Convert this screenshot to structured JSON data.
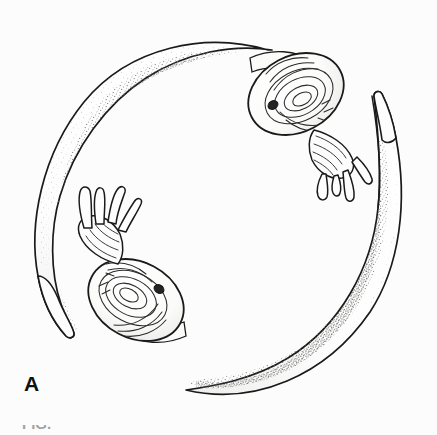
{
  "figure": {
    "panel_label": "A",
    "caption_partial": "FIG.",
    "medium": "pen-and-ink-stipple-drawing",
    "background_color": "#fcfcfc",
    "ink_color": "#1a1a1a",
    "stipple_color": "#7a7a78",
    "body_fill": "#fefefe",
    "eye_spot_color": "#2a2a2a"
  },
  "animals": [
    {
      "id": "upper-right-slug",
      "name": "slug-upper-right",
      "head_position": "upper-right",
      "tail_position": "lower-left",
      "tentacle_count": 4,
      "tentacle_orientation": "pendant-downward",
      "has_eye_spot": true,
      "mantle_ridges": 9
    },
    {
      "id": "lower-left-slug",
      "name": "slug-lower-left",
      "head_position": "lower-left",
      "tail_position": "upper-right",
      "tentacle_count": 4,
      "tentacle_orientation": "erect-upward",
      "has_eye_spot": true,
      "mantle_ridges": 10
    }
  ],
  "annotations": {
    "arrangement": "head-to-tail-circular",
    "shading_style": "stipple"
  }
}
